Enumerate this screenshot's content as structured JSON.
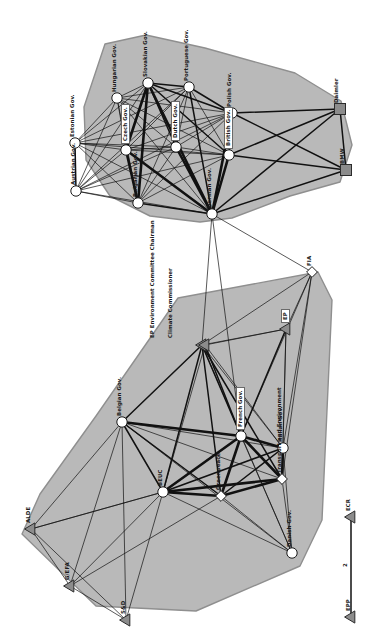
{
  "figure": {
    "type": "network-diagram",
    "title": "",
    "background": "#ffffff",
    "orientation_note": "labels rotated 90 degrees counter-clockwise"
  },
  "styles": {
    "hull_fill": "#b9b9b9",
    "hull_stroke": "#8f8f8f",
    "edge_color": "#111111",
    "node_circle_fill": "#ffffff",
    "node_circle_stroke": "#1a1a1a",
    "node_square_fill": "#8c8c8c",
    "node_square_stroke": "#2b2b2b",
    "node_triangle_fill": "#8c8c8c",
    "node_triangle_stroke": "#2b2b2b",
    "node_diamond_fill": "#ffffff",
    "node_diamond_stroke": "#1a1a1a",
    "label_color": "#1a1a1a"
  },
  "clusters": [
    {
      "name": "upper-coalition",
      "id": "cluster-top",
      "hull": [
        [
          105,
          44
        ],
        [
          146,
          35
        ],
        [
          205,
          48
        ],
        [
          295,
          73
        ],
        [
          341,
          101
        ],
        [
          352,
          145
        ],
        [
          340,
          182
        ],
        [
          290,
          196
        ],
        [
          232,
          218
        ],
        [
          200,
          222
        ],
        [
          150,
          216
        ],
        [
          110,
          196
        ],
        [
          86,
          160
        ],
        [
          84,
          107
        ]
      ]
    },
    {
      "name": "lower-coalition",
      "id": "cluster-bottom",
      "hull": [
        [
          178,
          298
        ],
        [
          318,
          272
        ],
        [
          332,
          300
        ],
        [
          322,
          520
        ],
        [
          300,
          566
        ],
        [
          196,
          611
        ],
        [
          96,
          606
        ],
        [
          22,
          534
        ],
        [
          40,
          494
        ],
        [
          96,
          416
        ]
      ]
    }
  ],
  "nodes": [
    {
      "id": "hungarian",
      "label": "Hungarian Gov.",
      "shape": "circle",
      "x": 117,
      "y": 98,
      "label_boxed": false,
      "lx": 112,
      "ly": 92
    },
    {
      "id": "slovakian",
      "label": "Slovakian Gov.",
      "shape": "circle",
      "x": 148,
      "y": 83,
      "label_boxed": false,
      "lx": 143,
      "ly": 77
    },
    {
      "id": "portuguese",
      "label": "Portuguese Gov.",
      "shape": "circle",
      "x": 189,
      "y": 87,
      "label_boxed": false,
      "lx": 184,
      "ly": 81
    },
    {
      "id": "polish",
      "label": "Polish Gov.",
      "shape": "circle",
      "x": 232,
      "y": 113,
      "label_boxed": false,
      "lx": 227,
      "ly": 107
    },
    {
      "id": "estonian",
      "label": "Estonian Gov.",
      "shape": "circle",
      "x": 75,
      "y": 143,
      "label_boxed": false,
      "lx": 70,
      "ly": 137
    },
    {
      "id": "czech",
      "label": "Czech Gov.",
      "shape": "circle",
      "x": 126,
      "y": 150,
      "label_boxed": true,
      "lx": 121,
      "ly": 144
    },
    {
      "id": "dutch",
      "label": "Dutch Gov.",
      "shape": "circle",
      "x": 176,
      "y": 147,
      "label_boxed": true,
      "lx": 171,
      "ly": 141
    },
    {
      "id": "british",
      "label": "British Gov.",
      "shape": "circle",
      "x": 229,
      "y": 155,
      "label_boxed": true,
      "lx": 224,
      "ly": 149
    },
    {
      "id": "austrian",
      "label": "Austrian Gov.",
      "shape": "circle",
      "x": 76,
      "y": 191,
      "label_boxed": false,
      "lx": 71,
      "ly": 185
    },
    {
      "id": "bulgarian",
      "label": "Bulgarian Gov.",
      "shape": "circle",
      "x": 138,
      "y": 203,
      "label_boxed": false,
      "lx": 133,
      "ly": 197
    },
    {
      "id": "german",
      "label": "German Gov.",
      "shape": "circle",
      "x": 212,
      "y": 214,
      "label_boxed": false,
      "lx": 207,
      "ly": 208
    },
    {
      "id": "daimler",
      "label": "Daimler",
      "shape": "square",
      "x": 340,
      "y": 109,
      "label_boxed": false,
      "lx": 334,
      "ly": 103
    },
    {
      "id": "bmw",
      "label": "BMW",
      "shape": "square",
      "x": 346,
      "y": 170,
      "label_boxed": false,
      "lx": 340,
      "ly": 164
    },
    {
      "id": "fia",
      "label": "FIA",
      "shape": "diamond",
      "x": 312,
      "y": 272,
      "label_boxed": false,
      "lx": 307,
      "ly": 266
    },
    {
      "id": "ep_env_chair",
      "label": "EP Environment Committee Chairman",
      "shape": "triangle",
      "x": 202,
      "y": 345,
      "label_boxed": false,
      "lx": 150,
      "ly": 338
    },
    {
      "id": "climate_commissioner",
      "label": "Climate Commissioner",
      "shape": "triangle",
      "x": 205,
      "y": 345,
      "label_boxed": false,
      "lx": 168,
      "ly": 338
    },
    {
      "id": "ep",
      "label": "EP",
      "shape": "triangle",
      "x": 286,
      "y": 329,
      "label_boxed": true,
      "lx": 281,
      "ly": 323
    },
    {
      "id": "belgian",
      "label": "Belgian Gov.",
      "shape": "circle",
      "x": 122,
      "y": 422,
      "label_boxed": false,
      "lx": 117,
      "ly": 416
    },
    {
      "id": "french",
      "label": "French Gov.",
      "shape": "circle",
      "x": 241,
      "y": 436,
      "label_boxed": true,
      "lx": 236,
      "ly": 430
    },
    {
      "id": "transport_env",
      "label": "Transport and Environment",
      "shape": "diamond",
      "x": 282,
      "y": 479,
      "label_boxed": false,
      "lx": 277,
      "ly": 473
    },
    {
      "id": "italian",
      "label": "Italian Gov.",
      "shape": "circle",
      "x": 283,
      "y": 448,
      "label_boxed": false,
      "lx": 278,
      "ly": 442
    },
    {
      "id": "beuc",
      "label": "BEUC",
      "shape": "circle",
      "x": 163,
      "y": 492,
      "label_boxed": false,
      "lx": 158,
      "ly": 486
    },
    {
      "id": "greenpeace",
      "label": "Greenpeace",
      "shape": "diamond",
      "x": 221,
      "y": 496,
      "label_boxed": false,
      "lx": 216,
      "ly": 490
    },
    {
      "id": "danish",
      "label": "Danish Gov.",
      "shape": "circle",
      "x": 292,
      "y": 553,
      "label_boxed": false,
      "lx": 287,
      "ly": 547
    },
    {
      "id": "alde",
      "label": "ALDE",
      "shape": "triangle",
      "x": 31,
      "y": 529,
      "label_boxed": false,
      "lx": 26,
      "ly": 523
    },
    {
      "id": "gefa",
      "label": "G/EFA",
      "shape": "triangle",
      "x": 70,
      "y": 586,
      "label_boxed": false,
      "lx": 65,
      "ly": 580
    },
    {
      "id": "sd",
      "label": "S&D",
      "shape": "triangle",
      "x": 126,
      "y": 620,
      "label_boxed": false,
      "lx": 121,
      "ly": 614
    },
    {
      "id": "ecr",
      "label": "ECR",
      "shape": "triangle",
      "x": 351,
      "y": 517,
      "label_boxed": false,
      "lx": 346,
      "ly": 511
    },
    {
      "id": "epp",
      "label": "EPP",
      "shape": "triangle",
      "x": 351,
      "y": 617,
      "label_boxed": false,
      "lx": 346,
      "ly": 611
    }
  ],
  "edge_labels": [
    {
      "text": "2",
      "x": 343,
      "y": 567
    }
  ],
  "edges_note": "weighted undirected ties; thickness encodes tie strength",
  "legend_items": []
}
